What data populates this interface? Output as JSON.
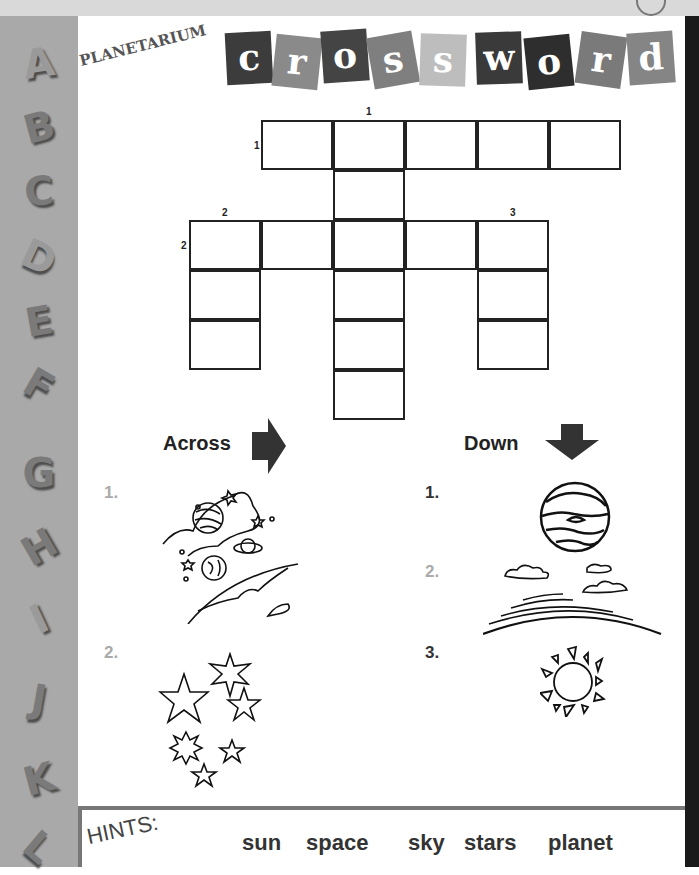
{
  "header": {
    "subtitle": "PLANETARIUM",
    "title_tiles": [
      {
        "letter": "c",
        "color": "#3c3c3c"
      },
      {
        "letter": "r",
        "color": "#8a8a8a"
      },
      {
        "letter": "o",
        "color": "#444444"
      },
      {
        "letter": "s",
        "color": "#7f7f7f"
      },
      {
        "letter": "s",
        "color": "#bdbdbd"
      },
      {
        "letter": "w",
        "color": "#3a3a3a"
      },
      {
        "letter": "o",
        "color": "#2e2e2e"
      },
      {
        "letter": "r",
        "color": "#7a7a7a"
      },
      {
        "letter": "d",
        "color": "#858585"
      }
    ]
  },
  "sidebar": {
    "letters": [
      "A",
      "B",
      "C",
      "D",
      "E",
      "F",
      "G",
      "H",
      "I",
      "J",
      "K",
      "L"
    ]
  },
  "grid": {
    "numbers": {
      "down1": "1",
      "across1": "1",
      "down2": "2",
      "across2": "2",
      "down3": "3"
    }
  },
  "clues": {
    "across": {
      "heading": "Across",
      "items": [
        {
          "num": "1.",
          "picture": "space-scene"
        },
        {
          "num": "2.",
          "picture": "stars"
        }
      ]
    },
    "down": {
      "heading": "Down",
      "items": [
        {
          "num": "1.",
          "picture": "planet"
        },
        {
          "num": "2.",
          "picture": "sky"
        },
        {
          "num": "3.",
          "picture": "sun"
        }
      ]
    }
  },
  "hints": {
    "title": "HINTS:",
    "words": [
      "sun",
      "space",
      "sky",
      "stars",
      "planet"
    ]
  }
}
